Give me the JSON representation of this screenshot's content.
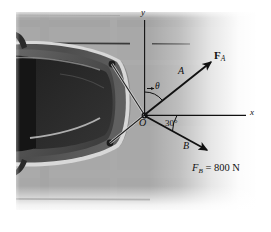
{
  "figure": {
    "kind": "physics-free-body-diagram",
    "background_color": "#a9a9a9",
    "page_color": "#ffffff",
    "line_color": "#1a1a1a",
    "car_body_color": "#4a4a4a",
    "car_window_color": "#2c2c2c"
  },
  "axes": {
    "x_label": "x",
    "y_label": "y",
    "origin_label": "O"
  },
  "points": {
    "a_label": "A",
    "b_label": "B"
  },
  "angles": {
    "theta_label": "θ",
    "theta_value_shown": "",
    "beta_label": "30°"
  },
  "forces": [
    {
      "name": "F_A",
      "symbol": "F",
      "subscript": "A",
      "label_text": "F",
      "magnitude_text": "",
      "direction": "up-right at angle theta above +x axis"
    },
    {
      "name": "F_B",
      "symbol": "F",
      "subscript": "B",
      "label_text": "F",
      "equals_text": " = 800 N",
      "magnitude_text": "800 N",
      "direction": "down-right at 30 degrees below +x axis"
    }
  ],
  "captions": {
    "fb_full": " = 800 N"
  }
}
